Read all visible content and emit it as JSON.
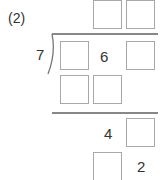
{
  "problem": {
    "label": "(2)",
    "divisor": "7",
    "dividend": [
      "",
      "6",
      ""
    ],
    "quotient": [
      "",
      ""
    ],
    "step1_product": [
      "",
      ""
    ],
    "step2_remainder_row": [
      "4",
      ""
    ],
    "step3_last": [
      "",
      "2"
    ]
  },
  "colors": {
    "box_border": "#a8a8a8",
    "line": "#888888",
    "text": "#333333"
  }
}
